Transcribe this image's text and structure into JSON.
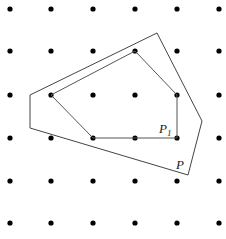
{
  "diagram": {
    "grid": {
      "xs": [
        10,
        51,
        93,
        135,
        177,
        219
      ],
      "ys": [
        9,
        51,
        95,
        138,
        181,
        223
      ],
      "dot_radius": 2.6,
      "dot_color": "#000000"
    },
    "polygons": [
      {
        "name": "P",
        "points": "157,33 202,121 188,175 30,128 30,95",
        "stroke": "#444444",
        "label": {
          "main": "P",
          "sub": "",
          "x": 176,
          "y": 169
        }
      },
      {
        "name": "P1",
        "points": "135,51 177,95 177,138 93,138 51,95",
        "stroke": "#555555",
        "label": {
          "main": "P",
          "sub": "1",
          "x": 159,
          "y": 133
        }
      }
    ]
  }
}
